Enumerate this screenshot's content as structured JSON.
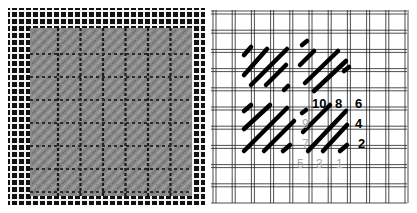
{
  "figure": {
    "left_panel": {
      "description": "Photograph of finished diagonal needlepoint stitch sample on canvas"
    },
    "right_panel": {
      "description": "Stitch diagram showing diagonal stitch order",
      "labels_bold": [
        {
          "text": "10",
          "x": 102,
          "y": 100
        },
        {
          "text": "8",
          "x": 125,
          "y": 100
        },
        {
          "text": "6",
          "x": 145,
          "y": 100
        },
        {
          "text": "4",
          "x": 145,
          "y": 120
        },
        {
          "text": "2",
          "x": 148,
          "y": 140
        }
      ],
      "labels_light": [
        {
          "text": "9",
          "x": 92,
          "y": 120
        },
        {
          "text": "7",
          "x": 92,
          "y": 140
        },
        {
          "text": "5",
          "x": 87,
          "y": 160
        },
        {
          "text": "3",
          "x": 106,
          "y": 160
        },
        {
          "text": "1",
          "x": 126,
          "y": 160
        }
      ]
    }
  }
}
